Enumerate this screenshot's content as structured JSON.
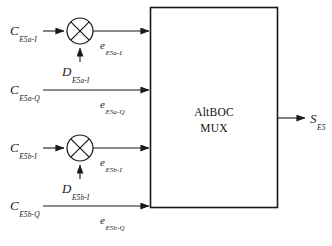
{
  "figure": {
    "type": "block-diagram",
    "background_color": "#ffffff",
    "line_color": "#1a1a1a",
    "text_color": "#1a1a1a"
  },
  "processor": {
    "label_line1": "AltBOC",
    "label_line2": "MUX",
    "shape": "rectangle"
  },
  "inputs": [
    {
      "id": "e5a-i",
      "carrier_base": "C",
      "carrier_sub": "E5a-I",
      "data_base": "D",
      "data_sub": "E5a-I",
      "output_base": "e",
      "output_sub": "E5a-I",
      "has_mixer": true,
      "mixer_name": "multiplier-e5a-i"
    },
    {
      "id": "e5a-q",
      "carrier_base": "C",
      "carrier_sub": "E5a-Q",
      "data_base": "",
      "data_sub": "",
      "output_base": "e",
      "output_sub": "E5a-Q",
      "has_mixer": false,
      "mixer_name": ""
    },
    {
      "id": "e5b-i",
      "carrier_base": "C",
      "carrier_sub": "E5b-I",
      "data_base": "D",
      "data_sub": "E5b-I",
      "output_base": "e",
      "output_sub": "E5b-I",
      "has_mixer": true,
      "mixer_name": "multiplier-e5b-i"
    },
    {
      "id": "e5b-q",
      "carrier_base": "C",
      "carrier_sub": "E5b-Q",
      "data_base": "",
      "data_sub": "",
      "output_base": "e",
      "output_sub": "E5b-Q",
      "has_mixer": false,
      "mixer_name": ""
    }
  ],
  "output": {
    "base": "S",
    "sub": "E5"
  }
}
